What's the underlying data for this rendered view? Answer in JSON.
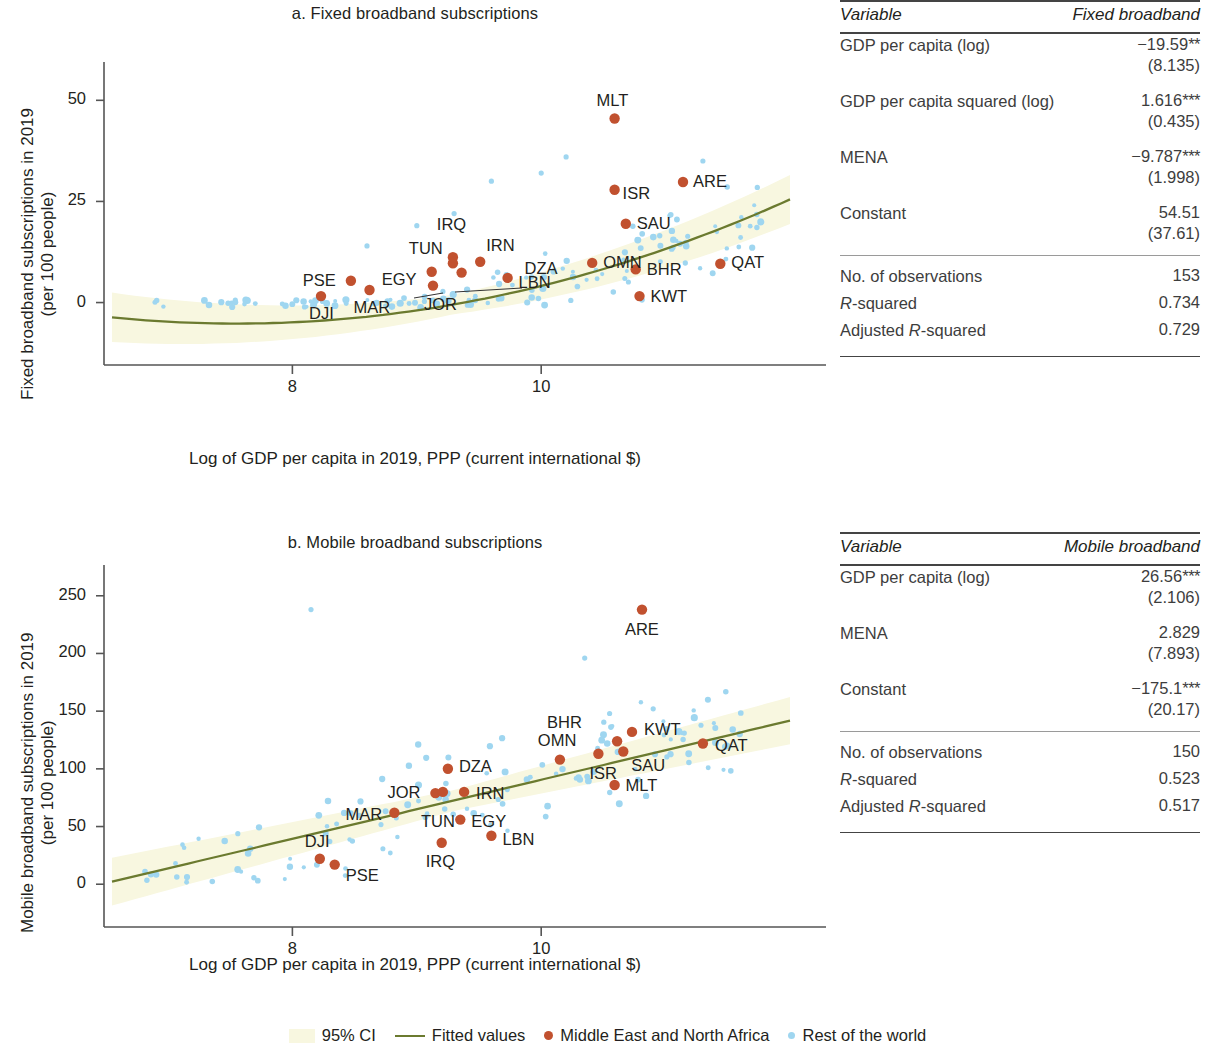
{
  "legend": {
    "ci": "95% CI",
    "fitted": "Fitted values",
    "mena": "Middle East and North Africa",
    "row": "Rest of the world",
    "colors": {
      "ci": "#f8f7e0",
      "fitted": "#6b7a2f",
      "mena": "#c1512f",
      "row": "#9fd6f0"
    }
  },
  "panel_a": {
    "title": "a. Fixed broadband subscriptions",
    "table": {
      "headers": [
        "Variable",
        "Fixed broadband"
      ],
      "rows": [
        {
          "variable": "GDP per capita (log)",
          "coef": "−19.59",
          "stars": "**",
          "se": "(8.135)"
        },
        {
          "variable": "GDP per capita squared (log)",
          "coef": "1.616",
          "stars": "***",
          "se": "(0.435)"
        },
        {
          "variable": "MENA",
          "coef": "−9.787",
          "stars": "***",
          "se": "(1.998)"
        },
        {
          "variable": "Constant",
          "coef": "54.51",
          "stars": "",
          "se": "(37.61)"
        }
      ],
      "stats": [
        {
          "label": "No. of observations",
          "value": "153"
        },
        {
          "label": "R-squared",
          "value": "0.734",
          "italic_prefix": "R"
        },
        {
          "label": "Adjusted R-squared",
          "value": "0.729"
        }
      ]
    }
  },
  "panel_b": {
    "title": "b. Mobile broadband subscriptions",
    "table": {
      "headers": [
        "Variable",
        "Mobile broadband"
      ],
      "rows": [
        {
          "variable": "GDP per capita (log)",
          "coef": "26.56",
          "stars": "***",
          "se": "(2.106)"
        },
        {
          "variable": "MENA",
          "coef": "2.829",
          "stars": "",
          "se": "(7.893)"
        },
        {
          "variable": "Constant",
          "coef": "−175.1",
          "stars": "***",
          "se": "(20.17)"
        }
      ],
      "stats": [
        {
          "label": "No. of observations",
          "value": "150"
        },
        {
          "label": "R-squared",
          "value": "0.523"
        },
        {
          "label": "Adjusted R-squared",
          "value": "0.517"
        }
      ]
    }
  },
  "chart_data": [
    {
      "type": "scatter",
      "panel": "a",
      "title": "a. Fixed broadband subscriptions",
      "xlabel": "Log of GDP per capita in 2019, PPP (current international $)",
      "ylabel": "Fixed broadband subscriptions in 2019 (per 100 people)",
      "ylabel_line1": "Fixed broadband subscriptions in 2019",
      "ylabel_line2": "(per 100 people)",
      "xticks": [
        8,
        10
      ],
      "yticks": [
        0,
        25,
        50
      ],
      "xlim": [
        6.55,
        12.0
      ],
      "ylim": [
        -10,
        57
      ],
      "grid": false,
      "legend_position": "bottom",
      "series": [
        {
          "name": "Middle East and North Africa",
          "color": "#c1512f",
          "points": [
            {
              "label": "DJI",
              "x": 8.23,
              "y": 1.6
            },
            {
              "label": "MAR",
              "x": 8.62,
              "y": 3.1
            },
            {
              "label": "PSE",
              "x": 8.47,
              "y": 5.4
            },
            {
              "label": "EGY",
              "x": 9.12,
              "y": 7.6
            },
            {
              "label": "JOR",
              "x": 9.13,
              "y": 4.2
            },
            {
              "label": "TUN",
              "x": 9.29,
              "y": 9.7
            },
            {
              "label": "IRQ",
              "x": 9.29,
              "y": 11.2
            },
            {
              "label": "DZA",
              "x": 9.36,
              "y": 7.4
            },
            {
              "label": "IRN",
              "x": 9.51,
              "y": 10.1
            },
            {
              "label": "LBN",
              "x": 9.73,
              "y": 6.1
            },
            {
              "label": "OMN",
              "x": 10.41,
              "y": 9.8
            },
            {
              "label": "ISR",
              "x": 10.59,
              "y": 27.9
            },
            {
              "label": "MLT",
              "x": 10.59,
              "y": 45.5
            },
            {
              "label": "SAU",
              "x": 10.68,
              "y": 19.5
            },
            {
              "label": "BHR",
              "x": 10.76,
              "y": 8.2
            },
            {
              "label": "KWT",
              "x": 10.79,
              "y": 1.6
            },
            {
              "label": "ARE",
              "x": 11.14,
              "y": 29.8
            },
            {
              "label": "QAT",
              "x": 11.44,
              "y": 9.6
            }
          ]
        },
        {
          "name": "Rest of the world",
          "color": "#9fd6f0",
          "n_points": 135
        }
      ],
      "fit": {
        "name": "Fitted values",
        "color": "#6b7a2f",
        "shape": "quadratic"
      },
      "ci": {
        "name": "95% CI",
        "color": "#f8f7e0",
        "level": 0.95
      }
    },
    {
      "type": "scatter",
      "panel": "b",
      "title": "b. Mobile broadband subscriptions",
      "xlabel": "Log of GDP per capita in 2019, PPP (current international $)",
      "ylabel": "Mobile broadband subscriptions in 2019 (per 100 people)",
      "ylabel_line1": "Mobile broadband subscriptions in 2019",
      "ylabel_line2": "(per 100 people)",
      "xticks": [
        8,
        10
      ],
      "yticks": [
        0,
        50,
        100,
        150,
        200,
        250
      ],
      "xlim": [
        6.55,
        12.0
      ],
      "ylim": [
        -18,
        268
      ],
      "grid": false,
      "legend_position": "bottom",
      "series": [
        {
          "name": "Middle East and North Africa",
          "color": "#c1512f",
          "points": [
            {
              "label": "DJI",
              "x": 8.22,
              "y": 22
            },
            {
              "label": "PSE",
              "x": 8.34,
              "y": 17
            },
            {
              "label": "MAR",
              "x": 8.82,
              "y": 62
            },
            {
              "label": "JOR",
              "x": 9.15,
              "y": 79
            },
            {
              "label": "TUN",
              "x": 9.21,
              "y": 80
            },
            {
              "label": "IRQ",
              "x": 9.2,
              "y": 36
            },
            {
              "label": "DZA",
              "x": 9.25,
              "y": 100
            },
            {
              "label": "IRN",
              "x": 9.38,
              "y": 80
            },
            {
              "label": "EGY",
              "x": 9.35,
              "y": 56
            },
            {
              "label": "LBN",
              "x": 9.6,
              "y": 42
            },
            {
              "label": "OMN",
              "x": 10.15,
              "y": 108
            },
            {
              "label": "ISR",
              "x": 10.46,
              "y": 113
            },
            {
              "label": "BHR",
              "x": 10.61,
              "y": 124
            },
            {
              "label": "SAU",
              "x": 10.66,
              "y": 115
            },
            {
              "label": "KWT",
              "x": 10.73,
              "y": 132
            },
            {
              "label": "MLT",
              "x": 10.59,
              "y": 86
            },
            {
              "label": "ARE",
              "x": 10.81,
              "y": 238
            },
            {
              "label": "QAT",
              "x": 11.3,
              "y": 122
            }
          ]
        },
        {
          "name": "Rest of the world",
          "color": "#9fd6f0",
          "n_points": 132
        }
      ],
      "fit": {
        "name": "Fitted values",
        "color": "#6b7a2f",
        "shape": "linear"
      },
      "ci": {
        "name": "95% CI",
        "color": "#f8f7e0",
        "level": 0.95
      }
    }
  ]
}
